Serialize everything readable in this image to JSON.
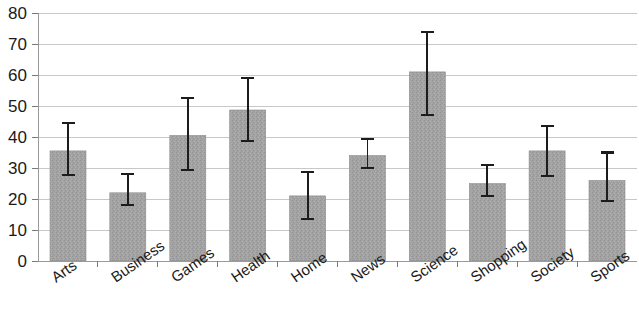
{
  "chart_data": {
    "type": "bar",
    "title": "",
    "subtitle": "",
    "xlabel": "",
    "ylabel": "",
    "ylim": [
      0,
      80
    ],
    "xlim_categories": 10,
    "grid": true,
    "gridlines_axis": "y",
    "legend": null,
    "legend_position": "none",
    "yticks": [
      0,
      10,
      20,
      30,
      40,
      50,
      60,
      70,
      80
    ],
    "ytick_labels": [
      "0",
      "10",
      "20",
      "30",
      "40",
      "50",
      "60",
      "70",
      "80"
    ],
    "categories": [
      "Arts",
      "Business",
      "Games",
      "Health",
      "Home",
      "News",
      "Science",
      "Shopping",
      "Society",
      "Sports"
    ],
    "values": [
      35.5,
      22.0,
      40.5,
      48.7,
      21.0,
      34.0,
      61.0,
      25.0,
      35.5,
      26.0
    ],
    "error_upper": [
      44.5,
      28.0,
      52.5,
      59.0,
      28.7,
      39.5,
      74.0,
      31.0,
      43.5,
      35.0
    ],
    "error_lower": [
      27.7,
      18.0,
      29.5,
      38.7,
      13.5,
      30.0,
      47.0,
      21.0,
      27.5,
      19.5
    ],
    "bar_color": "#a0a0a0",
    "error_bar_color": "#1c1c1c",
    "grid_color": "#c8c8c8",
    "axis_color": "#9a9a9a",
    "xtick_label_rotation": 35,
    "series": [
      {
        "name": "",
        "values": [
          35.5,
          22.0,
          40.5,
          48.7,
          21.0,
          34.0,
          61.0,
          25.0,
          35.5,
          26.0
        ]
      }
    ]
  },
  "geometry": {
    "plot_left": 38,
    "plot_right": 637,
    "plot_top": 13,
    "plot_bottom": 261,
    "bar_width_px": 36
  }
}
